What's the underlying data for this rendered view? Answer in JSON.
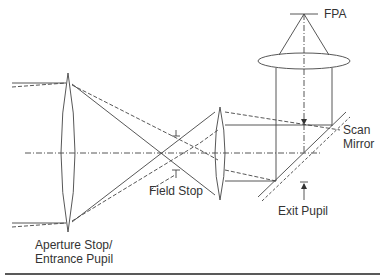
{
  "diagram": {
    "labels": {
      "fpa": "FPA",
      "scan_mirror_line1": "Scan",
      "scan_mirror_line2": "Mirror",
      "field_stop": "Field Stop",
      "exit_pupil": "Exit Pupil",
      "aperture_stop_line1": "Aperture Stop/",
      "aperture_stop_line2": "Entrance Pupil"
    },
    "colors": {
      "line": "#444444",
      "text": "#333333",
      "background": "#ffffff"
    },
    "elements": [
      {
        "name": "objective-lens",
        "type": "biconvex-lens",
        "label": "Aperture Stop/ Entrance Pupil"
      },
      {
        "name": "field-stop",
        "type": "stop"
      },
      {
        "name": "relay-lens",
        "type": "biconvex-lens"
      },
      {
        "name": "scan-mirror",
        "type": "mirror"
      },
      {
        "name": "exit-pupil",
        "type": "pupil-marker"
      },
      {
        "name": "focusing-lens",
        "type": "lens"
      },
      {
        "name": "fpa",
        "type": "detector"
      }
    ],
    "ray_styles": [
      "solid (on-axis bundle)",
      "dashed (off-axis bundle)",
      "dash-dot (optical axis)"
    ]
  }
}
